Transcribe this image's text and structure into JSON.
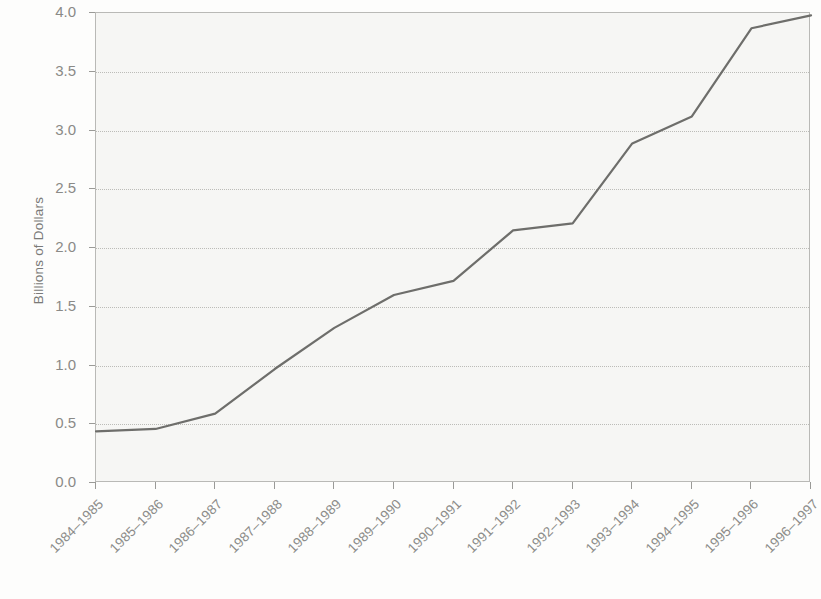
{
  "chart_data": {
    "type": "line",
    "title": "",
    "xlabel": "",
    "ylabel": "Billions of Dollars",
    "categories": [
      "1984–1985",
      "1985–1986",
      "1986–1987",
      "1987–1988",
      "1988–1989",
      "1989–1990",
      "1990–1991",
      "1991–1992",
      "1992–1993",
      "1993–1994",
      "1994–1995",
      "1995–1996",
      "1996–1997"
    ],
    "values": [
      0.44,
      0.46,
      0.59,
      0.97,
      1.32,
      1.6,
      1.72,
      2.15,
      2.21,
      2.89,
      3.12,
      3.87,
      3.98
    ],
    "series": [
      {
        "name": "Billions of Dollars",
        "values": [
          0.44,
          0.46,
          0.59,
          0.97,
          1.32,
          1.6,
          1.72,
          2.15,
          2.21,
          2.89,
          3.12,
          3.87,
          3.98
        ]
      }
    ],
    "ylim": [
      0.0,
      4.0
    ],
    "ytick_labels": [
      "0.0",
      "0.5",
      "1.0",
      "1.5",
      "2.0",
      "2.5",
      "3.0",
      "3.5",
      "4.0"
    ],
    "ytick_values": [
      0.0,
      0.5,
      1.0,
      1.5,
      2.0,
      2.5,
      3.0,
      3.5,
      4.0
    ],
    "grid": true,
    "grid_axis": "y",
    "legend": false,
    "legend_position": "none",
    "line_color": "#6e6e6b",
    "line_width": 2.2,
    "markers": false,
    "plot_background": "#f6f6f4",
    "axis_color": "#b9b9b6",
    "tick_label_color": "#8a8a87",
    "xtick_rotation": -45
  }
}
